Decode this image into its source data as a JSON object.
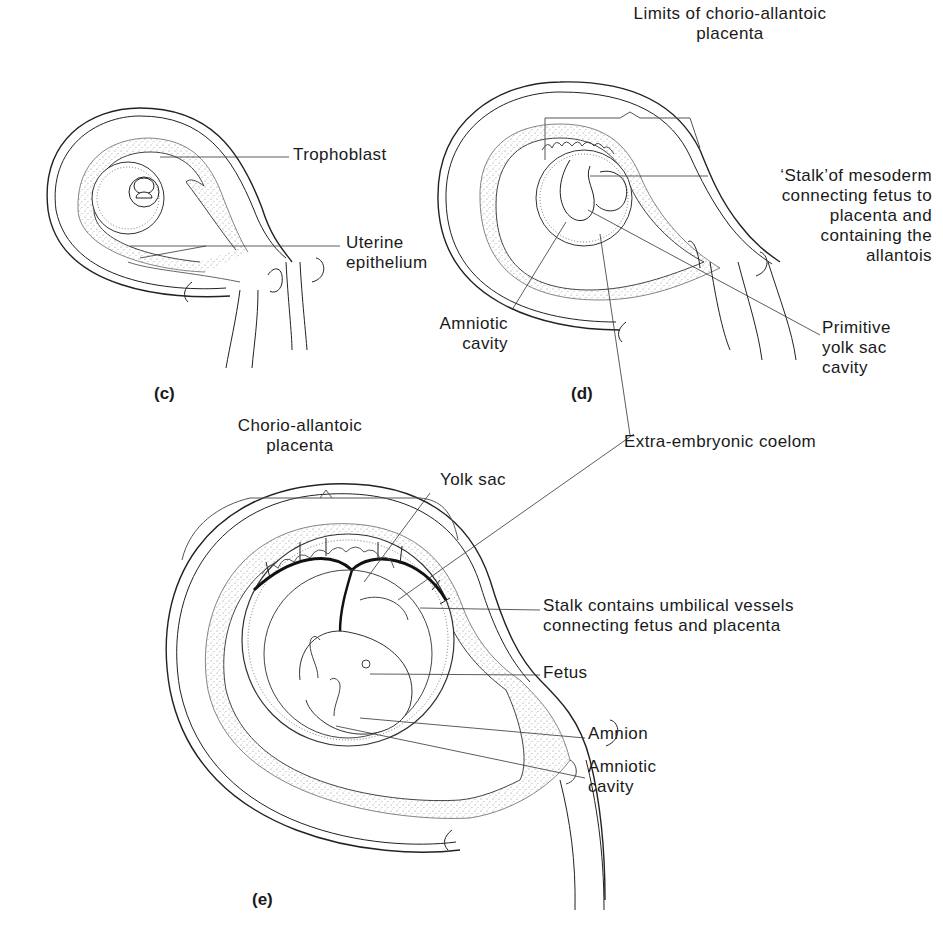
{
  "figure": {
    "panels": [
      {
        "id": "c",
        "label": "(c)"
      },
      {
        "id": "d",
        "label": "(d)"
      },
      {
        "id": "e",
        "label": "(e)"
      }
    ],
    "panel_c": {
      "labels": {
        "trophoblast": "Trophoblast",
        "uterine_epithelium": "Uterine\nepithelium"
      }
    },
    "panel_d": {
      "labels": {
        "limits_placenta": "Limits of chorio-allantoic\nplacenta",
        "stalk_mesoderm": "‘Stalk’of mesoderm\nconnecting fetus to\nplacenta and\ncontaining the\nallantois",
        "amniotic_cavity": "Amniotic\ncavity",
        "primitive_yolk_sac": "Primitive\nyolk sac\ncavity"
      }
    },
    "shared": {
      "extra_embryonic_coelom": "Extra-embryonic coelom"
    },
    "panel_e": {
      "labels": {
        "chorio_allantoic_placenta": "Chorio-allantoic\nplacenta",
        "yolk_sac": "Yolk sac",
        "stalk_umbilical": "Stalk contains umbilical vessels\nconnecting fetus and placenta",
        "fetus": "Fetus",
        "amnion": "Amnion",
        "amniotic_cavity": "Amniotic\ncavity"
      }
    },
    "colors": {
      "ink": "#1a1a1a",
      "stipple": "#9a9a9a",
      "background": "#ffffff"
    }
  }
}
